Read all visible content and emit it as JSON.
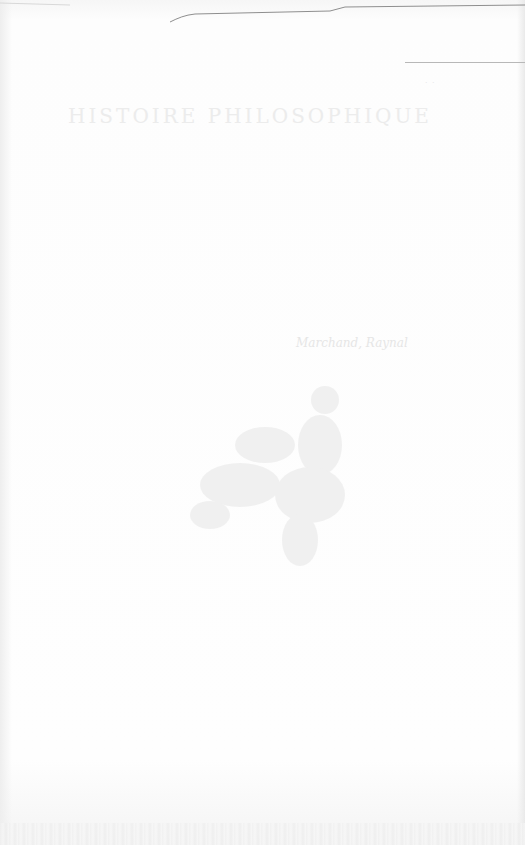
{
  "document": {
    "title": "HISTOIRE PHILOSOPHIQUE",
    "signature": "Marchand, Raynal",
    "small_mark": "· ·",
    "illustration": "faint-engraving-vignette"
  },
  "colors": {
    "paper": "#fdfdfd",
    "rule": "#b8b8b8",
    "faint_text": "#ececec"
  }
}
